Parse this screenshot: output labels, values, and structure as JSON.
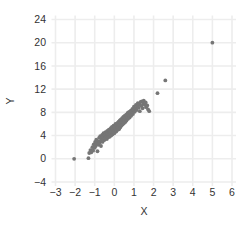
{
  "chart_data": {
    "type": "scatter",
    "title": "",
    "subtitle": "",
    "xlabel": "X",
    "ylabel": "Y",
    "xlim": [
      -3,
      6
    ],
    "ylim": [
      -4,
      24
    ],
    "xticks": [
      -3,
      -2,
      -1,
      0,
      1,
      2,
      3,
      4,
      5,
      6
    ],
    "yticks": [
      -4,
      0,
      4,
      8,
      12,
      16,
      20,
      24
    ],
    "xtick_labels": [
      "−3",
      "−2",
      "−1",
      "0",
      "1",
      "2",
      "3",
      "4",
      "5",
      "6"
    ],
    "ytick_labels": [
      "−4",
      "0",
      "4",
      "8",
      "12",
      "16",
      "20",
      "24"
    ],
    "grid": true,
    "grid_color": "#ededed",
    "legend": false,
    "legend_position": "none",
    "background_color": "#ffffff",
    "marker_color": "#767676",
    "marker_size": 1.9,
    "series": [
      {
        "name": "points",
        "points": [
          [
            -2.05,
            0.0
          ],
          [
            -1.32,
            0.1
          ],
          [
            -1.28,
            1.0
          ],
          [
            -1.22,
            1.5
          ],
          [
            -1.18,
            1.1
          ],
          [
            -1.12,
            2.0
          ],
          [
            -1.08,
            1.4
          ],
          [
            -1.05,
            2.5
          ],
          [
            -1.0,
            1.9
          ],
          [
            -0.98,
            2.9
          ],
          [
            -0.95,
            2.2
          ],
          [
            -0.92,
            3.3
          ],
          [
            -0.9,
            2.6
          ],
          [
            -0.86,
            1.3
          ],
          [
            -0.84,
            3.0
          ],
          [
            -0.8,
            2.4
          ],
          [
            -0.78,
            3.6
          ],
          [
            -0.75,
            2.8
          ],
          [
            -0.72,
            3.9
          ],
          [
            -0.7,
            3.1
          ],
          [
            -0.68,
            2.2
          ],
          [
            -0.65,
            3.5
          ],
          [
            -0.62,
            4.1
          ],
          [
            -0.6,
            2.9
          ],
          [
            -0.58,
            3.8
          ],
          [
            -0.55,
            4.4
          ],
          [
            -0.52,
            3.2
          ],
          [
            -0.5,
            4.0
          ],
          [
            -0.48,
            3.5
          ],
          [
            -0.45,
            4.6
          ],
          [
            -0.43,
            3.9
          ],
          [
            -0.4,
            4.2
          ],
          [
            -0.38,
            3.4
          ],
          [
            -0.36,
            4.8
          ],
          [
            -0.34,
            4.1
          ],
          [
            -0.32,
            3.7
          ],
          [
            -0.3,
            4.5
          ],
          [
            -0.28,
            5.0
          ],
          [
            -0.26,
            4.3
          ],
          [
            -0.24,
            3.8
          ],
          [
            -0.22,
            4.9
          ],
          [
            -0.2,
            4.4
          ],
          [
            -0.18,
            5.3
          ],
          [
            -0.16,
            4.0
          ],
          [
            -0.14,
            4.7
          ],
          [
            -0.12,
            5.5
          ],
          [
            -0.1,
            4.2
          ],
          [
            -0.08,
            5.0
          ],
          [
            -0.06,
            4.6
          ],
          [
            -0.04,
            5.7
          ],
          [
            -0.02,
            5.1
          ],
          [
            0.0,
            4.4
          ],
          [
            0.02,
            5.4
          ],
          [
            0.04,
            4.9
          ],
          [
            0.06,
            6.0
          ],
          [
            0.08,
            5.2
          ],
          [
            0.1,
            4.7
          ],
          [
            0.12,
            5.8
          ],
          [
            0.14,
            5.3
          ],
          [
            0.16,
            6.2
          ],
          [
            0.18,
            5.0
          ],
          [
            0.2,
            5.6
          ],
          [
            0.22,
            6.4
          ],
          [
            0.24,
            5.1
          ],
          [
            0.26,
            5.9
          ],
          [
            0.28,
            6.6
          ],
          [
            0.3,
            5.4
          ],
          [
            0.32,
            6.1
          ],
          [
            0.34,
            6.8
          ],
          [
            0.36,
            5.7
          ],
          [
            0.38,
            6.3
          ],
          [
            0.4,
            7.0
          ],
          [
            0.42,
            5.9
          ],
          [
            0.44,
            6.5
          ],
          [
            0.46,
            7.2
          ],
          [
            0.48,
            6.1
          ],
          [
            0.5,
            6.7
          ],
          [
            0.52,
            7.4
          ],
          [
            0.55,
            6.3
          ],
          [
            0.58,
            7.0
          ],
          [
            0.6,
            7.6
          ],
          [
            0.62,
            6.6
          ],
          [
            0.65,
            7.2
          ],
          [
            0.68,
            7.9
          ],
          [
            0.7,
            6.9
          ],
          [
            0.72,
            7.5
          ],
          [
            0.75,
            8.1
          ],
          [
            0.78,
            7.1
          ],
          [
            0.8,
            7.8
          ],
          [
            0.84,
            8.3
          ],
          [
            0.86,
            7.4
          ],
          [
            0.9,
            8.0
          ],
          [
            0.92,
            8.6
          ],
          [
            0.95,
            7.7
          ],
          [
            0.98,
            8.4
          ],
          [
            1.0,
            9.0
          ],
          [
            1.04,
            8.1
          ],
          [
            1.08,
            8.7
          ],
          [
            1.1,
            9.3
          ],
          [
            1.14,
            8.4
          ],
          [
            1.18,
            9.1
          ],
          [
            1.2,
            9.6
          ],
          [
            1.24,
            8.8
          ],
          [
            1.28,
            9.4
          ],
          [
            1.3,
            8.2
          ],
          [
            1.34,
            9.8
          ],
          [
            1.38,
            9.1
          ],
          [
            1.4,
            9.9
          ],
          [
            1.44,
            8.7
          ],
          [
            1.48,
            9.5
          ],
          [
            1.5,
            10.0
          ],
          [
            1.55,
            9.3
          ],
          [
            1.6,
            9.7
          ],
          [
            1.62,
            8.9
          ],
          [
            1.68,
            9.2
          ],
          [
            1.72,
            8.5
          ],
          [
            1.78,
            8.2
          ],
          [
            2.2,
            11.3
          ],
          [
            2.6,
            13.5
          ],
          [
            5.0,
            20.0
          ]
        ]
      }
    ]
  },
  "axes": {
    "x_title": "X",
    "y_title": "Y"
  }
}
